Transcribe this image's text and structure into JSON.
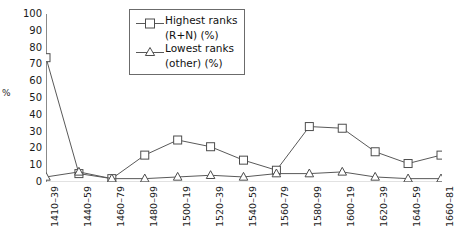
{
  "chart_data": {
    "type": "line",
    "title": "",
    "xlabel": "",
    "ylabel": "%",
    "ylim": [
      0,
      100
    ],
    "ytick_step": 10,
    "grid": false,
    "legend_position": "top-center",
    "yticks": [
      "100",
      "90",
      "80",
      "70",
      "60",
      "50",
      "40",
      "30",
      "20",
      "10",
      "0"
    ],
    "categories": [
      "1410–39",
      "1440–59",
      "1460–79",
      "1480–99",
      "1500–19",
      "1520–39",
      "1540–59",
      "1560–79",
      "1580–99",
      "1600–19",
      "1620–39",
      "1640–59",
      "1660–81"
    ],
    "series": [
      {
        "name": "Highest ranks (R+N) (%)",
        "marker": "square",
        "color": "#595959",
        "values": [
          74,
          5,
          2,
          16,
          25,
          21,
          13,
          7,
          33,
          32,
          18,
          11,
          16
        ]
      },
      {
        "name": "Lowest ranks (other) (%)",
        "marker": "triangle",
        "color": "#595959",
        "values": [
          3,
          6,
          2,
          2,
          3,
          4,
          3,
          5,
          5,
          6,
          3,
          2,
          2
        ]
      }
    ]
  },
  "legend": {
    "entries": [
      {
        "line1": "Highest ranks",
        "line2": "(R+N) (%)",
        "marker": "square"
      },
      {
        "line1": "Lowest ranks",
        "line2": "(other) (%)",
        "marker": "triangle"
      }
    ]
  }
}
